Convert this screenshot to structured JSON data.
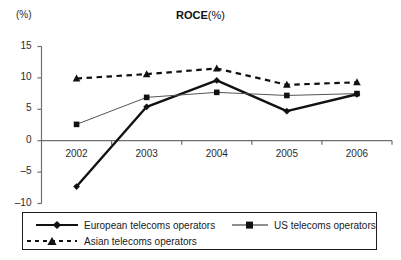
{
  "chart_data": {
    "type": "line",
    "title_main": "ROCE",
    "title_sub": "(%)",
    "ylabel": "(%)",
    "xlabel": "",
    "categories": [
      "2002",
      "2003",
      "2004",
      "2005",
      "2006"
    ],
    "x": [
      2002,
      2003,
      2004,
      2005,
      2006
    ],
    "ylim": [
      -10,
      15
    ],
    "yticks": [
      "15",
      "10",
      "5",
      "0",
      "-5",
      "-10"
    ],
    "ytick_values": [
      15,
      10,
      5,
      0,
      -5,
      -10
    ],
    "grid": false,
    "legend_position": "bottom",
    "zero_line": 0,
    "series": [
      {
        "name": "European telecoms operators",
        "values": [
          -7.3,
          5.4,
          9.6,
          4.7,
          7.4
        ],
        "marker": "diamond",
        "line_style": "solid",
        "line_width": 2.4,
        "color": "#111111"
      },
      {
        "name": "US telecoms operators",
        "values": [
          2.6,
          6.9,
          7.7,
          7.2,
          7.5
        ],
        "marker": "square",
        "line_style": "solid",
        "line_width": 1.0,
        "color": "#555555"
      },
      {
        "name": "Asian telecoms operators",
        "values": [
          9.9,
          10.6,
          11.5,
          8.9,
          9.3
        ],
        "marker": "triangle",
        "line_style": "dashed",
        "line_width": 2.2,
        "color": "#111111"
      }
    ]
  },
  "legend": {
    "items": [
      {
        "label": "European telecoms operators"
      },
      {
        "label": "US telecoms operators"
      },
      {
        "label": "Asian telecoms operators"
      }
    ]
  },
  "colors": {
    "european": "#111111",
    "us": "#555555",
    "asian": "#111111",
    "axis": "#6f6f6f",
    "text": "#1a1a1a"
  }
}
